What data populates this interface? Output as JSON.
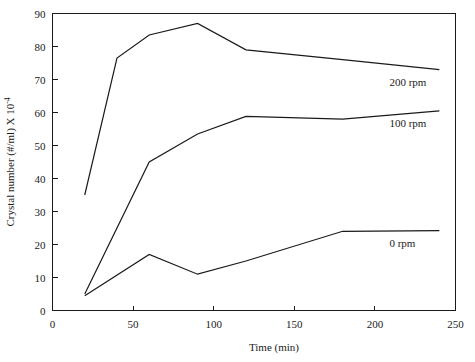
{
  "chart_data": {
    "type": "line",
    "title": "",
    "xlabel": "Time (min)",
    "ylabel": "Crystal number (#/ml) X 10",
    "ylabel_exponent": "-4",
    "xlim": [
      0,
      250
    ],
    "ylim": [
      0,
      90
    ],
    "xticks": [
      0,
      50,
      100,
      150,
      200,
      250
    ],
    "yticks": [
      0,
      10,
      20,
      30,
      40,
      50,
      60,
      70,
      80,
      90
    ],
    "xtick_labels": [
      "0",
      "50",
      "100",
      "150",
      "200",
      "250"
    ],
    "ytick_labels": [
      "0",
      "10",
      "20",
      "30",
      "40",
      "50",
      "60",
      "70",
      "80",
      "90"
    ],
    "grid": false,
    "legend_position": "inline-right",
    "series": [
      {
        "name": "200 rpm",
        "label": "200 rpm",
        "color": "#1a1a1a",
        "x": [
          20,
          40,
          60,
          90,
          120,
          180,
          240
        ],
        "values": [
          35,
          76.5,
          83.5,
          87,
          79,
          76,
          73
        ]
      },
      {
        "name": "100 rpm",
        "label": "100 rpm",
        "color": "#1a1a1a",
        "x": [
          20,
          60,
          90,
          120,
          180,
          240
        ],
        "values": [
          5,
          45,
          53.5,
          58.8,
          58,
          60.5
        ]
      },
      {
        "name": "0 rpm",
        "label": "0 rpm",
        "color": "#1a1a1a",
        "x": [
          20,
          60,
          90,
          120,
          180,
          240
        ],
        "values": [
          4.5,
          17,
          11,
          15,
          24,
          24.2
        ]
      }
    ]
  }
}
